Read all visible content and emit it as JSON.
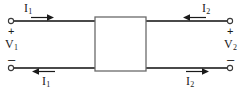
{
  "diagram": {
    "canvas": {
      "width": 242,
      "height": 95,
      "background": "#ffffff"
    },
    "stroke_color": "#4a4a4a",
    "text_color": "#1a1a1a",
    "black_box": {
      "label": ""
    },
    "ports": {
      "port1": {
        "voltage": {
          "symbol": "V",
          "subscript": "1"
        },
        "current_top": {
          "symbol": "I",
          "subscript": "1"
        },
        "current_bottom": {
          "symbol": "I",
          "subscript": "1"
        },
        "polarity_positive": "+",
        "polarity_negative": "–",
        "top_arrow_direction": "right",
        "bottom_arrow_direction": "left"
      },
      "port2": {
        "voltage": {
          "symbol": "V",
          "subscript": "2"
        },
        "current_top": {
          "symbol": "I",
          "subscript": "2"
        },
        "current_bottom": {
          "symbol": "I",
          "subscript": "2"
        },
        "polarity_positive": "+",
        "polarity_negative": "–",
        "top_arrow_direction": "left",
        "bottom_arrow_direction": "right"
      }
    }
  }
}
